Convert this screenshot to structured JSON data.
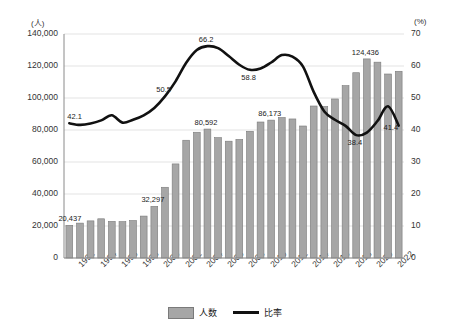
{
  "chart_data": {
    "type": "bar",
    "title": "",
    "xlabel": "",
    "ylabel": "(人)",
    "y2label": "(%)",
    "grid": true,
    "legend_position": "bottom",
    "ylim": [
      0,
      140000
    ],
    "y2lim": [
      0,
      70
    ],
    "yticks": [
      "0",
      "20,000",
      "40,000",
      "60,000",
      "80,000",
      "100,000",
      "120,000",
      "140,000"
    ],
    "y2ticks": [
      "0",
      "10",
      "20",
      "30",
      "40",
      "50",
      "60",
      "70"
    ],
    "categories": [
      "1992",
      "1993",
      "1994",
      "1995",
      "1996",
      "1997",
      "1998",
      "1999",
      "2000",
      "2001",
      "2002",
      "2003",
      "2004",
      "2005",
      "2006",
      "2007",
      "2008",
      "2009",
      "2010",
      "2011",
      "2012",
      "2013",
      "2014",
      "2015",
      "2016",
      "2017",
      "2018",
      "2019",
      "2020",
      "2021",
      "2022",
      "2023"
    ],
    "xtick_labels": [
      "1992",
      "1994",
      "1996",
      "1998",
      "2000",
      "2002",
      "2004",
      "2006",
      "2008",
      "2010",
      "2012",
      "2014",
      "2016",
      "2018",
      "2020",
      "2022"
    ],
    "series": [
      {
        "name": "人数",
        "type": "bar",
        "axis": "left",
        "color": "#a6a6a6",
        "edge_color": "#7a7a7a",
        "values": [
          20437,
          21800,
          23200,
          24500,
          22900,
          22700,
          23400,
          26200,
          32297,
          44200,
          58800,
          73600,
          78600,
          80592,
          75200,
          73000,
          74100,
          79200,
          85000,
          86173,
          87800,
          86900,
          82500,
          95000,
          94700,
          99400,
          107700,
          115800,
          124436,
          122400,
          115000,
          116700
        ]
      },
      {
        "name": "比率",
        "type": "line",
        "axis": "right",
        "color": "#111111",
        "values": [
          42.1,
          41.6,
          42.0,
          43.0,
          44.6,
          42.3,
          43.2,
          44.6,
          46.9,
          50.5,
          55.2,
          61.0,
          65.0,
          66.2,
          65.6,
          63.1,
          60.4,
          58.8,
          59.2,
          61.1,
          63.4,
          62.9,
          59.8,
          51.9,
          45.8,
          43.2,
          41.3,
          38.4,
          39.2,
          42.8,
          47.4,
          41.4
        ]
      }
    ],
    "annotations": [
      {
        "text": "20,437",
        "series": "人数",
        "category": "1992"
      },
      {
        "text": "32,297",
        "series": "人数",
        "category": "2000"
      },
      {
        "text": "80,592",
        "series": "人数",
        "category": "2005"
      },
      {
        "text": "86,173",
        "series": "人数",
        "category": "2011"
      },
      {
        "text": "124,436",
        "series": "人数",
        "category": "2020"
      },
      {
        "text": "42.1",
        "series": "比率",
        "category": "1992"
      },
      {
        "text": "50.5",
        "series": "比率",
        "category": "2001"
      },
      {
        "text": "66.2",
        "series": "比率",
        "category": "2005"
      },
      {
        "text": "58.8",
        "series": "比率",
        "category": "2009"
      },
      {
        "text": "38.4",
        "series": "比率",
        "category": "2019"
      },
      {
        "text": "41.4",
        "series": "比率",
        "category": "2023"
      }
    ]
  },
  "legend": {
    "bar_label": "人数",
    "line_label": "比率"
  }
}
